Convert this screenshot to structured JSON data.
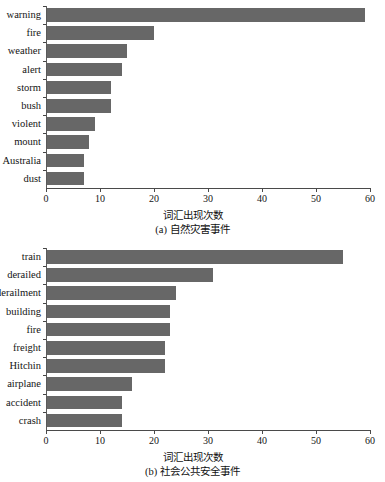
{
  "figure": {
    "bar_color": "#676767",
    "axis_color": "#4a4a4a",
    "background": "#ffffff"
  },
  "chart_data": [
    {
      "type": "bar",
      "orientation": "horizontal",
      "panel_label": "(a)",
      "title": "",
      "caption": "(a) 自然灾害事件",
      "xlabel": "词汇出现次数",
      "ylabel": "",
      "xlim": [
        0,
        60
      ],
      "xticks": [
        0,
        10,
        20,
        30,
        40,
        50,
        60
      ],
      "xticklabels": [
        "0",
        "10",
        "20",
        "30",
        "40",
        "50",
        "60"
      ],
      "grid": false,
      "legend": null,
      "categories": [
        "warning",
        "fire",
        "weather",
        "alert",
        "storm",
        "bush",
        "violent",
        "mount",
        "Australia",
        "dust"
      ],
      "values": [
        59,
        20,
        15,
        14,
        12,
        12,
        9,
        8,
        7,
        7
      ]
    },
    {
      "type": "bar",
      "orientation": "horizontal",
      "panel_label": "(b)",
      "title": "",
      "caption": "(b) 社会公共安全事件",
      "xlabel": "词汇出现次数",
      "ylabel": "",
      "xlim": [
        0,
        60
      ],
      "xticks": [
        0,
        10,
        20,
        30,
        40,
        50,
        60
      ],
      "xticklabels": [
        "0",
        "10",
        "20",
        "30",
        "40",
        "50",
        "60"
      ],
      "grid": false,
      "legend": null,
      "categories": [
        "train",
        "derailed",
        "derailment",
        "building",
        "fire",
        "freight",
        "Hitchin",
        "airplane",
        "accident",
        "crash"
      ],
      "values": [
        55,
        31,
        24,
        23,
        23,
        22,
        22,
        16,
        14,
        14
      ]
    }
  ]
}
